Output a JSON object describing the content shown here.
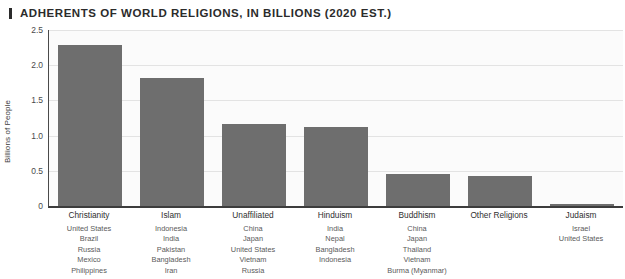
{
  "title": "ADHERENTS OF WORLD RELIGIONS, IN BILLIONS (2020 EST.)",
  "title_marker": "vertical-bar-marker",
  "colors": {
    "bar": "#6e6e6e",
    "axis": "#3c3c3c",
    "gridline": "#e3e3e3",
    "title": "#2b2b2b",
    "background": "#ffffff",
    "plot_background": "#fbfbfb"
  },
  "chart_data": {
    "type": "bar",
    "title": "ADHERENTS OF WORLD RELIGIONS, IN BILLIONS (2020 EST.)",
    "xlabel": "",
    "ylabel": "Billions of People",
    "ylim": [
      0,
      2.5
    ],
    "yticks": [
      0,
      0.5,
      1.0,
      1.5,
      2.0,
      2.5
    ],
    "ytick_labels": [
      "0",
      "0.5",
      "1.0",
      "1.5",
      "2.0",
      "2.5"
    ],
    "grid": true,
    "legend": "none",
    "categories": [
      "Christianity",
      "Islam",
      "Unaffiliated",
      "Hinduism",
      "Buddhism",
      "Other Religions",
      "Judaism"
    ],
    "values": [
      2.29,
      1.82,
      1.17,
      1.12,
      0.45,
      0.43,
      0.015
    ]
  },
  "category_details": [
    {
      "name": "Christianity",
      "countries": [
        "United States",
        "Brazil",
        "Russia",
        "Mexico",
        "Philippines"
      ]
    },
    {
      "name": "Islam",
      "countries": [
        "Indonesia",
        "India",
        "Pakistan",
        "Bangladesh",
        "Iran"
      ]
    },
    {
      "name": "Unaffiliated",
      "countries": [
        "China",
        "Japan",
        "United States",
        "Vietnam",
        "Russia"
      ]
    },
    {
      "name": "Hinduism",
      "countries": [
        "India",
        "Nepal",
        "Bangladesh",
        "Indonesia"
      ]
    },
    {
      "name": "Buddhism",
      "countries": [
        "China",
        "Japan",
        "Thailand",
        "Vietnam",
        "Burma (Myanmar)"
      ]
    },
    {
      "name": "Other Religions",
      "countries": []
    },
    {
      "name": "Judaism",
      "countries": [
        "Israel",
        "United States"
      ]
    }
  ]
}
